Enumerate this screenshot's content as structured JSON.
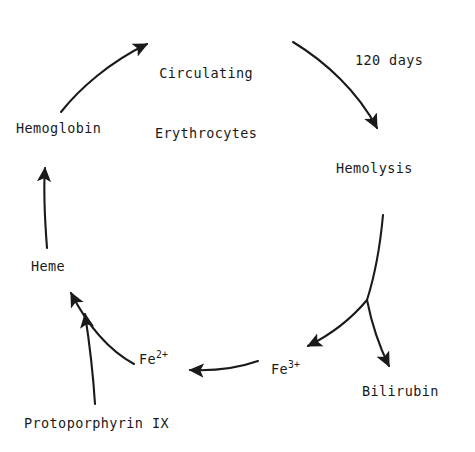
{
  "figure": {
    "kind": "cycle-diagram",
    "background_color": "#ffffff",
    "ink_color": "#1a1a1a"
  },
  "nodes": [
    {
      "id": "circulating-erythrocytes",
      "line1": "Circulating",
      "line2": "Erythrocytes",
      "x": 155,
      "y": 22
    },
    {
      "id": "hemolysis",
      "line1": "Hemolysis",
      "line2": "",
      "x": 336,
      "y": 159
    },
    {
      "id": "bilirubin",
      "line1": "Bilirubin",
      "line2": "",
      "x": 362,
      "y": 382
    },
    {
      "id": "fe3",
      "base": "Fe",
      "charge": "3+",
      "line1": "Fe3+",
      "line2": "",
      "x": 271,
      "y": 358
    },
    {
      "id": "fe2",
      "base": "Fe",
      "charge": "2+",
      "line1": "Fe2+",
      "line2": "",
      "x": 139,
      "y": 348
    },
    {
      "id": "protoporphyrin-ix",
      "line1": "Protoporphyrin IX",
      "line2": "",
      "x": 24,
      "y": 414
    },
    {
      "id": "heme",
      "line1": "Heme",
      "line2": "",
      "x": 31,
      "y": 257
    },
    {
      "id": "hemoglobin",
      "line1": "Hemoglobin",
      "line2": "",
      "x": 16,
      "y": 119
    }
  ],
  "edge_labels": [
    {
      "id": "duration-120-days",
      "text": "120 days",
      "x": 355,
      "y": 52
    }
  ],
  "edges": [
    {
      "id": "hemoglobin-to-erythrocytes",
      "from": "hemoglobin",
      "to": "circulating-erythrocytes"
    },
    {
      "id": "erythrocytes-to-hemolysis",
      "from": "circulating-erythrocytes",
      "to": "hemolysis",
      "label": "120 days"
    },
    {
      "id": "hemolysis-to-bilirubin",
      "from": "hemolysis",
      "to": "bilirubin"
    },
    {
      "id": "hemolysis-to-fe3",
      "from": "hemolysis",
      "to": "fe3"
    },
    {
      "id": "fe3-to-fe2",
      "from": "fe3",
      "to": "fe2"
    },
    {
      "id": "fe2-to-heme",
      "from": "fe2",
      "to": "heme"
    },
    {
      "id": "protoporphyrin-to-heme",
      "from": "protoporphyrin-ix",
      "to": "heme"
    },
    {
      "id": "heme-to-hemoglobin",
      "from": "heme",
      "to": "hemoglobin"
    }
  ]
}
